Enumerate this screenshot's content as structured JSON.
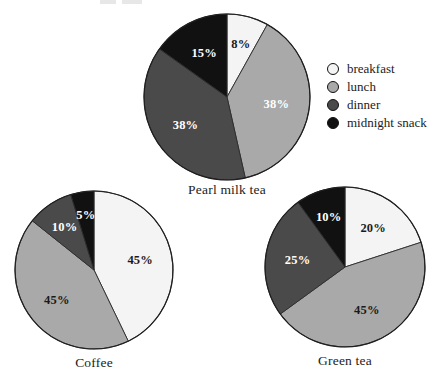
{
  "chart_data": {
    "type": "pie",
    "title": "",
    "legend_position": "right",
    "grid": false,
    "categories": [
      "breakfast",
      "lunch",
      "dinner",
      "midnight snack"
    ],
    "colors": [
      "#f4f4f4",
      "#a9a9a9",
      "#4a4a4a",
      "#111111"
    ],
    "charts": [
      {
        "title": "Pearl milk tea",
        "start_angle_deg": 0,
        "values": [
          8,
          38,
          38,
          15
        ],
        "labels": [
          "8%",
          "38%",
          "38%",
          "15%"
        ],
        "label_colors": [
          "#1a1a1a",
          "#ffffff",
          "#ffffff",
          "#ffffff"
        ]
      },
      {
        "title": "Coffee",
        "start_angle_deg": 0,
        "values": [
          45,
          45,
          10,
          5
        ],
        "labels": [
          "45%",
          "45%",
          "10%",
          "5%"
        ],
        "label_colors": [
          "#1a1a1a",
          "#1a1a1a",
          "#ffffff",
          "#ffffff"
        ]
      },
      {
        "title": "Green tea",
        "start_angle_deg": 0,
        "values": [
          20,
          45,
          25,
          10
        ],
        "labels": [
          "20%",
          "45%",
          "25%",
          "10%"
        ],
        "label_colors": [
          "#1a1a1a",
          "#1a1a1a",
          "#ffffff",
          "#ffffff"
        ]
      }
    ]
  },
  "legend": {
    "items": [
      {
        "label": "breakfast",
        "color": "#f4f4f4"
      },
      {
        "label": "lunch",
        "color": "#a9a9a9"
      },
      {
        "label": "dinner",
        "color": "#4a4a4a"
      },
      {
        "label": "midnight snack",
        "color": "#111111"
      }
    ]
  },
  "captions": {
    "pearl_milk_tea": "Pearl milk tea",
    "coffee": "Coffee",
    "green_tea": "Green tea"
  },
  "layout": {
    "pies": [
      {
        "key": "pearl_milk_tea",
        "cx": 227,
        "cy": 97,
        "r": 83,
        "caption_y": 182
      },
      {
        "key": "coffee",
        "cx": 94,
        "cy": 270,
        "r": 79,
        "caption_y": 355
      },
      {
        "key": "green_tea",
        "cx": 345,
        "cy": 267,
        "r": 80,
        "caption_y": 353
      }
    ]
  }
}
